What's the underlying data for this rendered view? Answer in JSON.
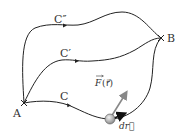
{
  "diagram": {
    "points": {
      "start": {
        "label": "A",
        "x": 24,
        "y": 103
      },
      "end": {
        "label": "B",
        "x": 161,
        "y": 38
      }
    },
    "paths": [
      {
        "id": "C_double_prime",
        "label": "C″"
      },
      {
        "id": "C_prime",
        "label": "C′"
      },
      {
        "id": "C",
        "label": "C"
      }
    ],
    "vectors": {
      "force": {
        "label_F": "F",
        "label_arg": "(r⃗)"
      },
      "displacement": {
        "label": "dr⃗"
      }
    },
    "colors": {
      "curve": "#222222",
      "force_arrow": "#888888",
      "particle": "#aaaaaa",
      "text": "#333333"
    }
  }
}
